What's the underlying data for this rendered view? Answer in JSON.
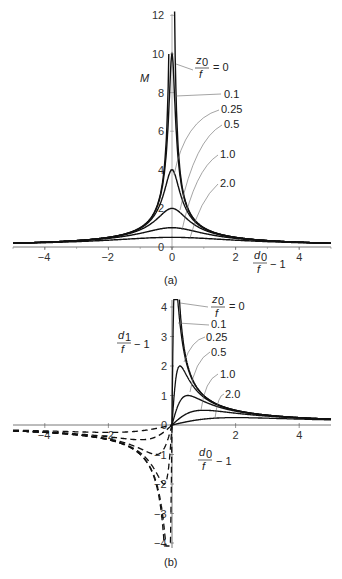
{
  "chart_data": [
    {
      "panel": "(a)",
      "type": "line",
      "title": "",
      "xlabel": "d0/f − 1",
      "ylabel": "M",
      "xlim": [
        -5,
        5
      ],
      "ylim": [
        0,
        12
      ],
      "xticks": [
        -4,
        -2,
        0,
        2,
        4
      ],
      "yticks": [
        0,
        2,
        4,
        6,
        8,
        10,
        12
      ],
      "grid": false,
      "legend_title": "z0/f =",
      "formula": "M = 1/sqrt((d0/f-1)^2 + (z0/f)^2)",
      "series": [
        {
          "name": "z0/f = 0",
          "z": 0,
          "peak": "infinite",
          "style": "solid"
        },
        {
          "name": "0.1",
          "z": 0.1,
          "peak": 10,
          "style": "solid"
        },
        {
          "name": "0.25",
          "z": 0.25,
          "peak": 4,
          "style": "solid"
        },
        {
          "name": "0.5",
          "z": 0.5,
          "peak": 2,
          "style": "solid"
        },
        {
          "name": "1.0",
          "z": 1.0,
          "peak": 1,
          "style": "solid"
        },
        {
          "name": "2.0",
          "z": 2.0,
          "peak": 0.5,
          "style": "solid"
        }
      ]
    },
    {
      "panel": "(b)",
      "type": "line",
      "title": "",
      "xlabel": "d0/f − 1",
      "ylabel": "d1/f − 1",
      "xlim": [
        -5,
        5
      ],
      "ylim": [
        -4,
        4
      ],
      "xticks": [
        -4,
        -2,
        0,
        2,
        4
      ],
      "yticks": [
        -4,
        -3,
        -2,
        -1,
        0,
        1,
        2,
        3,
        4
      ],
      "grid": false,
      "legend_title": "z0/f =",
      "formula": "d1/f - 1 = x / (x^2 + (z0/f)^2), x = d0/f - 1; solid for x>0, dashed for x<0",
      "series": [
        {
          "name": "z0/f = 0",
          "z": 0,
          "peak": "infinite"
        },
        {
          "name": "0.1",
          "z": 0.1,
          "peak": 5
        },
        {
          "name": "0.25",
          "z": 0.25,
          "peak": 2
        },
        {
          "name": "0.5",
          "z": 0.5,
          "peak": 1
        },
        {
          "name": "1.0",
          "z": 1.0,
          "peak": 0.5
        },
        {
          "name": "2.0",
          "z": 2.0,
          "peak": 0.25
        }
      ]
    }
  ],
  "panel_a": {
    "caption": "(a)",
    "ylabel": "M",
    "xlabel_num": "d",
    "xlabel_sub": "0",
    "xlabel_den": "f",
    "xlabel_tail": "− 1",
    "legend_num": "z",
    "legend_sub": "0",
    "legend_den": "f",
    "legend_eq": "= 0",
    "labels": [
      "0.1",
      "0.25",
      "0.5",
      "1.0",
      "2.0"
    ]
  },
  "panel_b": {
    "caption": "(b)",
    "ylabel_num": "d",
    "ylabel_sub": "1",
    "ylabel_den": "f",
    "ylabel_tail": "− 1",
    "xlabel_num": "d",
    "xlabel_sub": "0",
    "xlabel_den": "f",
    "xlabel_tail": "− 1",
    "legend_num": "z",
    "legend_sub": "0",
    "legend_den": "f",
    "legend_eq": "= 0",
    "labels": [
      "0.1",
      "0.25",
      "0.5",
      "1.0",
      "2.0"
    ]
  }
}
